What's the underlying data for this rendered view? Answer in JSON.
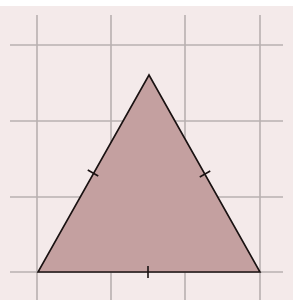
{
  "figure": {
    "title": "",
    "colors": {
      "background": "#f4eaea",
      "grid": "#b8b0b0",
      "triangle_fill": "#c4a0a0",
      "triangle_stroke": "#1a1212"
    },
    "grid": {
      "vertical_x": [
        37,
        111,
        185,
        260
      ],
      "horizontal_y": [
        45,
        121,
        197,
        272
      ],
      "x_range": [
        10,
        283
      ],
      "y_range": [
        15,
        300
      ]
    },
    "triangle": {
      "vertices": [
        [
          149,
          75
        ],
        [
          38,
          272
        ],
        [
          260,
          272
        ]
      ],
      "equal_side_ticks": [
        {
          "side": "left",
          "center": [
            93,
            173
          ]
        },
        {
          "side": "right",
          "center": [
            205,
            174
          ]
        },
        {
          "side": "bottom",
          "center": [
            148,
            272
          ]
        }
      ]
    }
  }
}
